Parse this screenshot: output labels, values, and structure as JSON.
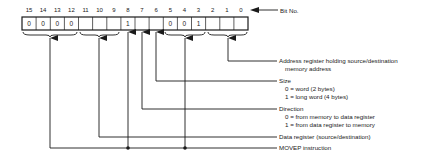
{
  "diagram": {
    "bit_no_label": "Bit No.",
    "bits": [
      {
        "num": "15",
        "value": "0"
      },
      {
        "num": "14",
        "value": "0"
      },
      {
        "num": "13",
        "value": "0"
      },
      {
        "num": "12",
        "value": "0"
      },
      {
        "num": "11",
        "value": ""
      },
      {
        "num": "10",
        "value": ""
      },
      {
        "num": "9",
        "value": ""
      },
      {
        "num": "8",
        "value": "1"
      },
      {
        "num": "7",
        "value": ""
      },
      {
        "num": "6",
        "value": ""
      },
      {
        "num": "5",
        "value": "0"
      },
      {
        "num": "4",
        "value": "0"
      },
      {
        "num": "3",
        "value": "1"
      },
      {
        "num": "2",
        "value": ""
      },
      {
        "num": "1",
        "value": ""
      },
      {
        "num": "0",
        "value": ""
      }
    ],
    "fields": {
      "address": {
        "label": "Address register holding source/destination",
        "label_cont": "memory address"
      },
      "size": {
        "label": "Size",
        "opt0": "0 = word (2 bytes)",
        "opt1": "1 = long word (4 bytes)"
      },
      "direction": {
        "label": "Direction",
        "opt0": "0 = from memory to data register",
        "opt1": "1 = from data register to memory"
      },
      "data_register": {
        "label": "Data register (source/destination)"
      },
      "movep": {
        "label": "MOVEP instruction"
      }
    }
  }
}
